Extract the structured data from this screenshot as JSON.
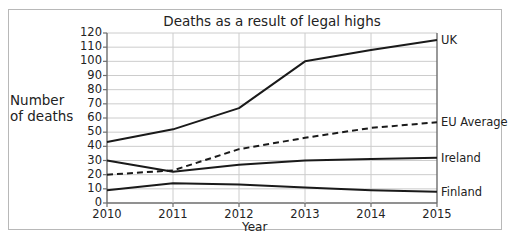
{
  "chart_data": {
    "type": "line",
    "title": "Deaths as a result of legal highs",
    "xlabel": "Year",
    "ylabel": "Number of deaths",
    "ylabel_lines": [
      "Number",
      "of deaths"
    ],
    "categories": [
      "2010",
      "2011",
      "2012",
      "2013",
      "2014",
      "2015"
    ],
    "x": [
      2010,
      2011,
      2012,
      2013,
      2014,
      2015
    ],
    "xlim": [
      2010,
      2015
    ],
    "ylim": [
      0,
      120
    ],
    "yticks": [
      0,
      10,
      20,
      30,
      40,
      50,
      60,
      70,
      80,
      90,
      100,
      110,
      120
    ],
    "ytick_labels": [
      "0",
      "10",
      "20",
      "30",
      "40",
      "50",
      "60",
      "70",
      "80",
      "90",
      "100",
      "110",
      "120"
    ],
    "grid": true,
    "grid_color": "#cccccc",
    "legend_position": "right-inline-end-labels",
    "line_color": "#1a1a1a",
    "series": [
      {
        "name": "UK",
        "label": "UK",
        "style": "solid",
        "values": [
          43,
          52,
          67,
          100,
          108,
          115
        ]
      },
      {
        "name": "EU Average",
        "label": "EU Average",
        "style": "dashed",
        "values": [
          20,
          23,
          38,
          46,
          53,
          57
        ]
      },
      {
        "name": "Ireland",
        "label": "Ireland",
        "style": "solid",
        "values": [
          30,
          22,
          27,
          30,
          31,
          32
        ]
      },
      {
        "name": "Finland",
        "label": "Finland",
        "style": "solid",
        "values": [
          9,
          14,
          13,
          11,
          9,
          8
        ]
      }
    ]
  }
}
